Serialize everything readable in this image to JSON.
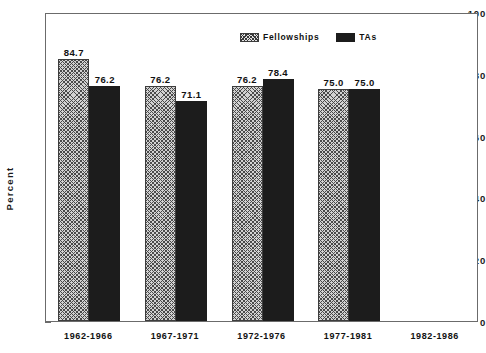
{
  "chart_data": {
    "type": "bar",
    "title": "",
    "subtitle": "",
    "xlabel": "",
    "ylabel": "Percent",
    "ylim": [
      0,
      100
    ],
    "yticks": [
      0,
      20,
      40,
      60,
      80,
      100
    ],
    "ytick_labels": [
      "0",
      "20",
      "40",
      "60",
      "80",
      "100"
    ],
    "grid": false,
    "legend_position": "top-center",
    "categories": [
      "1962-1966",
      "1967-1971",
      "1972-1976",
      "1977-1981",
      "1982-1986"
    ],
    "series": [
      {
        "name": "Fellowships",
        "pattern": "crosshatch",
        "color": "#d2d2d2",
        "values": [
          84.7,
          76.2,
          76.2,
          75.0,
          null
        ],
        "labels": [
          "84.7",
          "76.2",
          "76.2",
          "75.0",
          ""
        ]
      },
      {
        "name": "TAs",
        "pattern": "solid",
        "color": "#1c1c1c",
        "values": [
          76.2,
          71.1,
          78.4,
          75.0,
          null
        ],
        "labels": [
          "76.2",
          "71.1",
          "78.4",
          "75.0",
          ""
        ]
      }
    ],
    "annotations": []
  },
  "legend": {
    "items": [
      {
        "label": "Fellowships"
      },
      {
        "label": "TAs"
      }
    ]
  },
  "axis": {
    "y_title": "Percent"
  }
}
